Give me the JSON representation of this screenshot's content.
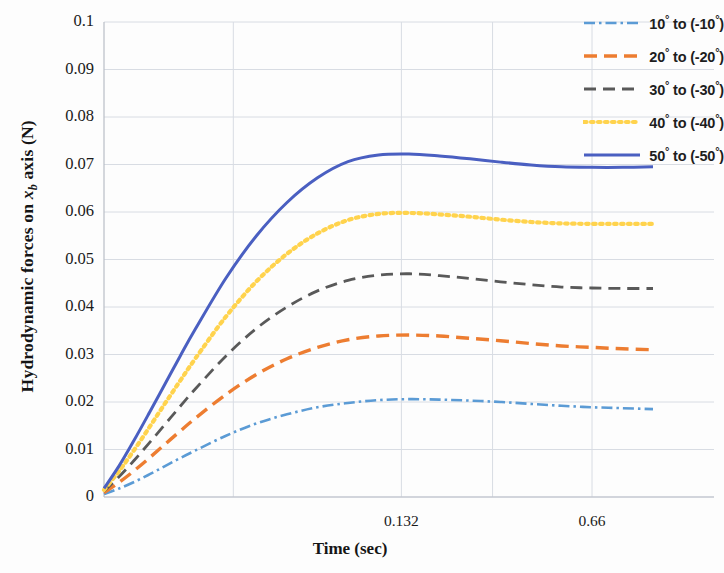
{
  "chart_data": {
    "type": "line",
    "title": "",
    "xlabel": "Time (sec)",
    "ylabel": "Hydrodynamic forces on  x_b axis (N)",
    "ylabel_prefix": "Hydrodynamic forces on ",
    "ylabel_var": "x",
    "ylabel_sub": "b",
    "ylabel_suffix": " axis (N)",
    "xlim": [
      0,
      0.88
    ],
    "ylim": [
      0,
      0.1
    ],
    "grid": true,
    "legend_position": "top-right",
    "yticks": [
      "0",
      "0.01",
      "0.02",
      "0.03",
      "0.04",
      "0.05",
      "0.06",
      "0.07",
      "0.08",
      "0.09",
      "0.1"
    ],
    "ytick_values": [
      0,
      0.01,
      0.02,
      0.03,
      0.04,
      0.05,
      0.06,
      0.07,
      0.08,
      0.09,
      0.1
    ],
    "xticks": [
      "0.132",
      "0.66"
    ],
    "xtick_values": [
      0.132,
      0.66
    ],
    "x": [
      0,
      0.022,
      0.044,
      0.066,
      0.088,
      0.11,
      0.132,
      0.176,
      0.22,
      0.264,
      0.308,
      0.352,
      0.396,
      0.44,
      0.484,
      0.528,
      0.572,
      0.616,
      0.66,
      0.704,
      0.748,
      0.792
    ],
    "series": [
      {
        "name": "10° to (-10°)",
        "label": "10",
        "label_to": "to",
        "label_neg": "(-10",
        "color": "#5B9BD5",
        "style": "dash-dot",
        "dasharray": "11,4,2.5,4",
        "width": 2.6,
        "values": [
          0.0006,
          0.0018,
          0.0032,
          0.0048,
          0.0065,
          0.0082,
          0.0098,
          0.0129,
          0.0155,
          0.0174,
          0.0189,
          0.0198,
          0.0204,
          0.0206,
          0.0205,
          0.0203,
          0.02,
          0.0196,
          0.0192,
          0.0189,
          0.0187,
          0.0185
        ]
      },
      {
        "name": "20° to (-20°)",
        "label": "20",
        "label_to": "to",
        "label_neg": "(-20",
        "color": "#ED7D31",
        "style": "dashed",
        "dasharray": "13,7",
        "width": 3.4,
        "values": [
          0.0009,
          0.0031,
          0.0056,
          0.0083,
          0.0111,
          0.0139,
          0.0166,
          0.0216,
          0.0258,
          0.0291,
          0.0315,
          0.0331,
          0.0339,
          0.0341,
          0.0339,
          0.0334,
          0.0329,
          0.0323,
          0.0318,
          0.0315,
          0.0312,
          0.031
        ]
      },
      {
        "name": "30° to (-30°)",
        "label": "30",
        "label_to": "to",
        "label_neg": "(-30",
        "color": "#595959",
        "style": "dashed",
        "dasharray": "12,7",
        "width": 2.8,
        "values": [
          0.0012,
          0.0043,
          0.0078,
          0.0115,
          0.0153,
          0.0191,
          0.0228,
          0.0297,
          0.0355,
          0.04,
          0.0434,
          0.0456,
          0.0467,
          0.047,
          0.0466,
          0.046,
          0.0453,
          0.0447,
          0.0442,
          0.044,
          0.0439,
          0.0439
        ]
      },
      {
        "name": "40° to (-40°)",
        "label": "40",
        "label_to": "to",
        "label_neg": "(-40",
        "color": "#FFD34D",
        "style": "dotted",
        "dasharray": "2.6,4.4",
        "width": 4.2,
        "values": [
          0.0015,
          0.0055,
          0.01,
          0.0148,
          0.0197,
          0.0245,
          0.0292,
          0.038,
          0.0454,
          0.0512,
          0.0555,
          0.0583,
          0.0596,
          0.0598,
          0.0595,
          0.059,
          0.0584,
          0.0579,
          0.0576,
          0.0575,
          0.0575,
          0.0575
        ]
      },
      {
        "name": "50° to (-50°)",
        "label": "50",
        "label_to": "to",
        "label_neg": "(-50",
        "color": "#4A5FC1",
        "style": "solid",
        "dasharray": "0",
        "width": 3.0,
        "values": [
          0.0018,
          0.0066,
          0.0121,
          0.0179,
          0.0238,
          0.0297,
          0.0354,
          0.0461,
          0.055,
          0.062,
          0.0672,
          0.0706,
          0.072,
          0.0722,
          0.0718,
          0.0712,
          0.0705,
          0.0699,
          0.0695,
          0.0694,
          0.0694,
          0.0695
        ]
      }
    ]
  }
}
